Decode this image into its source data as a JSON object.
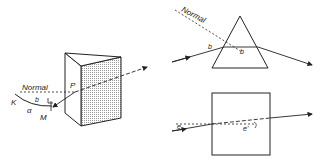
{
  "figure": {
    "panels": [
      {
        "id": "prism-3d",
        "description": "Triangular prism in perspective with ray incident at point P",
        "labels": {
          "normal": "Normal",
          "point_p": "P",
          "point_k": "K",
          "point_m": "M",
          "angle_alpha": "α",
          "angle_b": "b"
        }
      },
      {
        "id": "prism-2d",
        "description": "Triangular prism cross-section with refracted ray",
        "labels": {
          "normal": "Normal",
          "angle_b_in": "b",
          "angle_b_inside": "b"
        }
      },
      {
        "id": "slab-2d",
        "description": "Square slab with ray passing through",
        "labels": {
          "angle_e": "e",
          "angle_e_prime": "e'"
        }
      }
    ],
    "colors": {
      "line": "#222222",
      "shade": "#d9d9d9",
      "background": "#ffffff"
    }
  }
}
